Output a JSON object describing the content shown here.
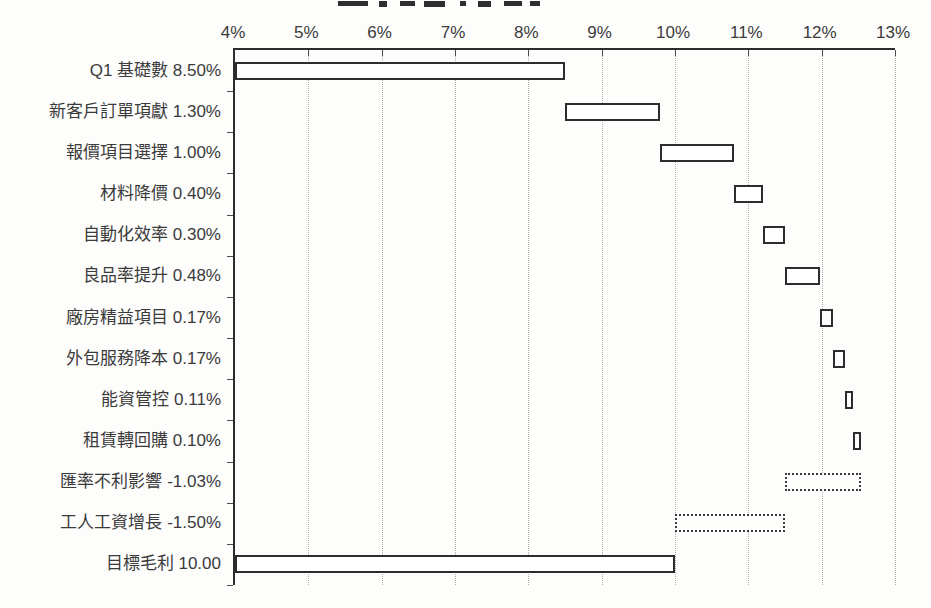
{
  "colors": {
    "background": "#fdfdfc",
    "axis_line": "#2d2d2d",
    "bar_border": "#2d2d2d",
    "bar_fill": "#ffffff",
    "gridline": "#adadad",
    "text": "#3b3b3b"
  },
  "chart_data": {
    "type": "bar",
    "orientation": "horizontal",
    "waterfall": true,
    "title": "",
    "xlabel": "",
    "ylabel": "",
    "xlim": [
      4,
      13
    ],
    "x_tick_labels": [
      "4%",
      "5%",
      "6%",
      "7%",
      "8%",
      "9%",
      "10%",
      "11%",
      "12%",
      "13%"
    ],
    "grid": "vertical-dotted",
    "legend": "none",
    "categories": [
      "Q1 基礎數",
      "新客戶訂單項獻",
      "報價項目選擇",
      "材料降價",
      "自動化效率",
      "良品率提升",
      "廠房精益項目",
      "外包服務降本",
      "能資管控",
      "租賃轉回購",
      "匯率不利影響",
      "工人工資增長",
      "目標毛利"
    ],
    "items": [
      {
        "display_text": "Q1 基礎數 8.50%",
        "value": 8.5,
        "bar_start": 4.0,
        "bar_end": 8.5,
        "border_style": "solid"
      },
      {
        "display_text": "新客戶訂單項獻 1.30%",
        "value": 1.3,
        "bar_start": 8.5,
        "bar_end": 9.8,
        "border_style": "solid"
      },
      {
        "display_text": "報價項目選擇 1.00%",
        "value": 1.0,
        "bar_start": 9.8,
        "bar_end": 10.8,
        "border_style": "solid"
      },
      {
        "display_text": "材料降價 0.40%",
        "value": 0.4,
        "bar_start": 10.8,
        "bar_end": 11.2,
        "border_style": "solid"
      },
      {
        "display_text": "自動化效率 0.30%",
        "value": 0.3,
        "bar_start": 11.2,
        "bar_end": 11.5,
        "border_style": "solid"
      },
      {
        "display_text": "良品率提升 0.48%",
        "value": 0.48,
        "bar_start": 11.5,
        "bar_end": 11.98,
        "border_style": "solid"
      },
      {
        "display_text": "廠房精益項目 0.17%",
        "value": 0.17,
        "bar_start": 11.98,
        "bar_end": 12.15,
        "border_style": "solid"
      },
      {
        "display_text": "外包服務降本 0.17%",
        "value": 0.17,
        "bar_start": 12.15,
        "bar_end": 12.32,
        "border_style": "solid"
      },
      {
        "display_text": "能資管控 0.11%",
        "value": 0.11,
        "bar_start": 12.32,
        "bar_end": 12.43,
        "border_style": "solid"
      },
      {
        "display_text": "租賃轉回購 0.10%",
        "value": 0.1,
        "bar_start": 12.43,
        "bar_end": 12.53,
        "border_style": "solid"
      },
      {
        "display_text": "匯率不利影響 -1.03%",
        "value": -1.03,
        "bar_start": 11.5,
        "bar_end": 12.53,
        "border_style": "dotted"
      },
      {
        "display_text": "工人工資增長 -1.50%",
        "value": -1.5,
        "bar_start": 10.0,
        "bar_end": 11.5,
        "border_style": "dotted"
      },
      {
        "display_text": "目標毛利 10.00",
        "value": 10.0,
        "bar_start": 4.0,
        "bar_end": 10.0,
        "border_style": "solid"
      }
    ]
  }
}
